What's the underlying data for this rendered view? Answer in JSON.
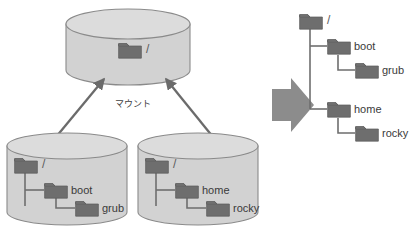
{
  "diagram": {
    "mount_label": "マウント",
    "colors": {
      "cylinder_fill": "#d2d2d2",
      "cylinder_top_fill": "#dcdcdc",
      "cylinder_stroke": "#8a8a8a",
      "folder_fill": "#6e6e6e",
      "folder_stroke": "#5c5c5c",
      "connector": "#6e6e6e",
      "arrow": "#6b6b6b",
      "block_arrow": "#8c8c8c",
      "text": "#3a3a3a",
      "background": "#ffffff"
    },
    "root_label": "/",
    "cylinders": [
      {
        "id": "target-root-filesystem",
        "name": "root-volume",
        "nodes": [
          {
            "label": "/",
            "depth": 0
          }
        ]
      },
      {
        "id": "boot-filesystem",
        "name": "boot-volume",
        "nodes": [
          {
            "label": "/",
            "depth": 0
          },
          {
            "label": "boot",
            "depth": 1
          },
          {
            "label": "grub",
            "depth": 2
          }
        ]
      },
      {
        "id": "home-filesystem",
        "name": "home-volume",
        "nodes": [
          {
            "label": "/",
            "depth": 0
          },
          {
            "label": "home",
            "depth": 1
          },
          {
            "label": "rocky",
            "depth": 2
          }
        ]
      }
    ],
    "result_tree": {
      "name": "merged-directory-tree",
      "nodes": [
        {
          "label": "/",
          "depth": 0
        },
        {
          "label": "boot",
          "depth": 1
        },
        {
          "label": "grub",
          "depth": 2
        },
        {
          "label": "home",
          "depth": 1
        },
        {
          "label": "rocky",
          "depth": 2
        }
      ]
    },
    "arrows": [
      {
        "name": "mount-arrow-left",
        "from": "boot-volume",
        "to": "root-volume"
      },
      {
        "name": "mount-arrow-right",
        "from": "home-volume",
        "to": "root-volume"
      },
      {
        "name": "result-block-arrow",
        "from": "mounted-cylinders",
        "to": "merged-directory-tree"
      }
    ]
  }
}
